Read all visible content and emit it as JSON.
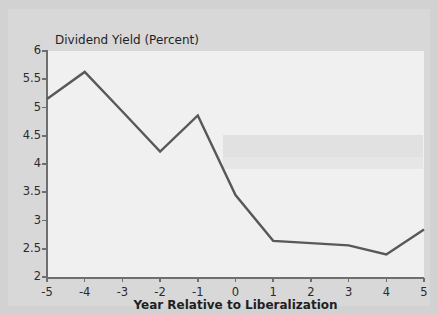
{
  "figure": {
    "background_color": "#d2d2d2",
    "panel_color": "#d8d8d8",
    "plot_background_color": "#f0f0f0",
    "axis_color": "#6e6e6e",
    "line_color": "#585858"
  },
  "chart_data": {
    "type": "line",
    "title": "",
    "ylabel": "Dividend Yield (Percent)",
    "xlabel": "Year Relative to Liberalization",
    "x": [
      -5,
      -4,
      -3,
      -2,
      -1,
      0,
      1,
      2,
      3,
      4,
      5
    ],
    "x_tick_labels": [
      "-5",
      "-4",
      "-3",
      "-2",
      "-1",
      "0",
      "1",
      "2",
      "3",
      "4",
      "5"
    ],
    "y_tick_labels": [
      "6",
      "5.5",
      "5",
      "4.5",
      "4",
      "3.5",
      "3",
      "2.5",
      "2"
    ],
    "y_ticks": [
      6,
      5.5,
      5,
      4.5,
      4,
      3.5,
      3,
      2.5,
      2
    ],
    "values": [
      5.15,
      5.63,
      4.93,
      4.22,
      4.86,
      3.45,
      2.64,
      2.6,
      2.56,
      2.4,
      2.84
    ],
    "xlim": [
      -5,
      5
    ],
    "ylim": [
      2,
      6
    ],
    "grid": false,
    "legend": null,
    "series": [
      {
        "name": "Dividend Yield",
        "values": [
          5.15,
          5.63,
          4.93,
          4.22,
          4.86,
          3.45,
          2.64,
          2.6,
          2.56,
          2.4,
          2.84
        ]
      }
    ],
    "annotations": []
  }
}
